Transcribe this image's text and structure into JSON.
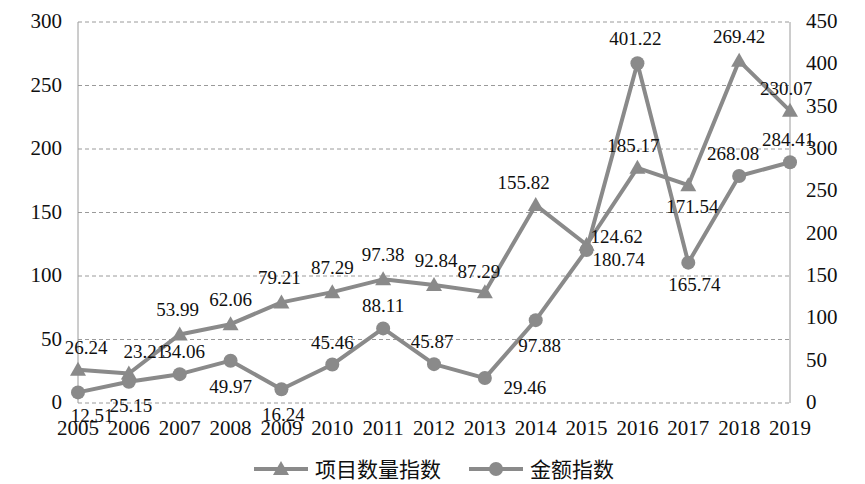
{
  "chart_data": {
    "type": "line",
    "title": "",
    "subtitle": "",
    "xlabel": "",
    "ylabel": "",
    "grid": true,
    "legend_position": "bottom",
    "categories": [
      "2005",
      "2006",
      "2007",
      "2008",
      "2009",
      "2010",
      "2011",
      "2012",
      "2013",
      "2014",
      "2015",
      "2016",
      "2017",
      "2018",
      "2019"
    ],
    "axes": {
      "left": {
        "min": 0,
        "max": 300,
        "step": 50,
        "ticks": [
          "0",
          "50",
          "100",
          "150",
          "200",
          "250",
          "300"
        ],
        "tick_values": [
          0,
          50,
          100,
          150,
          200,
          250,
          300
        ]
      },
      "right": {
        "min": 0,
        "max": 450,
        "step": 50,
        "ticks": [
          "0",
          "50",
          "100",
          "150",
          "200",
          "250",
          "300",
          "350",
          "400",
          "450"
        ],
        "tick_values": [
          0,
          50,
          100,
          150,
          200,
          250,
          300,
          350,
          400,
          450
        ]
      }
    },
    "series": [
      {
        "name": "项目数量指数",
        "axis": "left",
        "marker": "triangle",
        "color": "#8a8a8a",
        "values": [
          26.24,
          23.21,
          53.99,
          62.06,
          79.21,
          87.29,
          97.38,
          92.84,
          87.29,
          155.82,
          124.62,
          185.17,
          171.54,
          269.42,
          230.07
        ],
        "labels": [
          "26.24",
          "23.21",
          "53.99",
          "62.06",
          "79.21",
          "87.29",
          "97.38",
          "92.84",
          "87.29",
          "155.82",
          "124.62",
          "185.17",
          "171.54",
          "269.42",
          "230.07"
        ]
      },
      {
        "name": "金额指数",
        "axis": "right",
        "marker": "circle",
        "color": "#8a8a8a",
        "values": [
          12.51,
          25.15,
          34.06,
          49.97,
          16.24,
          45.46,
          88.11,
          45.87,
          29.46,
          97.88,
          180.74,
          401.22,
          165.74,
          268.08,
          284.41
        ],
        "labels": [
          "12.51",
          "25.15",
          "34.06",
          "49.97",
          "16.24",
          "45.46",
          "88.11",
          "45.87",
          "29.46",
          "97.88",
          "180.74",
          "401.22",
          "165.74",
          "268.08",
          "284.41"
        ]
      }
    ],
    "label_offsets": {
      "项目数量指数": [
        {
          "dx": 8,
          "dy": -22
        },
        {
          "dx": 16,
          "dy": -22
        },
        {
          "dx": -2,
          "dy": -24
        },
        {
          "dx": 0,
          "dy": -24
        },
        {
          "dx": -2,
          "dy": -24
        },
        {
          "dx": 0,
          "dy": -24
        },
        {
          "dx": 0,
          "dy": -24
        },
        {
          "dx": 2,
          "dy": -24
        },
        {
          "dx": -6,
          "dy": -20
        },
        {
          "dx": -12,
          "dy": -22
        },
        {
          "dx": 30,
          "dy": -8
        },
        {
          "dx": -4,
          "dy": -22
        },
        {
          "dx": 4,
          "dy": 22
        },
        {
          "dx": 0,
          "dy": -24
        },
        {
          "dx": -4,
          "dy": -22
        }
      ],
      "金额指数": [
        {
          "dx": 14,
          "dy": 24
        },
        {
          "dx": 2,
          "dy": 24
        },
        {
          "dx": 4,
          "dy": -22
        },
        {
          "dx": 0,
          "dy": 26
        },
        {
          "dx": 2,
          "dy": 26
        },
        {
          "dx": 0,
          "dy": -22
        },
        {
          "dx": 0,
          "dy": -22
        },
        {
          "dx": -2,
          "dy": -22
        },
        {
          "dx": 40,
          "dy": 10
        },
        {
          "dx": 4,
          "dy": 26
        },
        {
          "dx": 32,
          "dy": 10
        },
        {
          "dx": -2,
          "dy": -24
        },
        {
          "dx": 6,
          "dy": 22
        },
        {
          "dx": -6,
          "dy": -22
        },
        {
          "dx": -2,
          "dy": -22
        }
      ]
    }
  },
  "legend": {
    "items": [
      {
        "label": "项目数量指数",
        "marker": "triangle",
        "color": "#8a8a8a"
      },
      {
        "label": "金额指数",
        "marker": "circle",
        "color": "#8a8a8a"
      }
    ]
  },
  "style": {
    "series_color": "#8a8a8a",
    "grid_color": "#9a9a9a",
    "text_color": "#101010",
    "background": "#ffffff"
  }
}
